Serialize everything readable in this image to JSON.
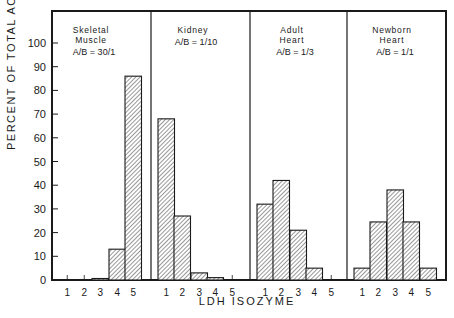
{
  "chart_data": {
    "type": "bar",
    "title": "",
    "xlabel": "LDH ISOZYME",
    "ylabel": "PERCENT OF TOTAL ACTIVITY",
    "ylim": [
      0,
      100
    ],
    "yticks": [
      0,
      10,
      20,
      30,
      40,
      50,
      60,
      70,
      80,
      90,
      100
    ],
    "categories": [
      "1",
      "2",
      "3",
      "4",
      "5"
    ],
    "grid": false,
    "panels": [
      {
        "name": "Skeletal Muscle",
        "label_lines": [
          "Skeletal",
          "Muscle"
        ],
        "ratio": "A/B = 30/1",
        "values": [
          0,
          0,
          0.5,
          13,
          86
        ]
      },
      {
        "name": "Kidney",
        "label_lines": [
          "Kidney"
        ],
        "ratio": "A/B = 1/10",
        "values": [
          68,
          27,
          3,
          1,
          0
        ]
      },
      {
        "name": "Adult Heart",
        "label_lines": [
          "Adult",
          "Heart"
        ],
        "ratio": "A/B = 1/3",
        "values": [
          32,
          42,
          21,
          5,
          0
        ]
      },
      {
        "name": "Newborn Heart",
        "label_lines": [
          "Newborn",
          "Heart"
        ],
        "ratio": "A/B = 1/1",
        "values": [
          5,
          24.5,
          38,
          24.5,
          5
        ]
      }
    ]
  },
  "colors": {
    "ink": "#1a1a1a",
    "hatch": "#333333",
    "background": "#ffffff"
  }
}
